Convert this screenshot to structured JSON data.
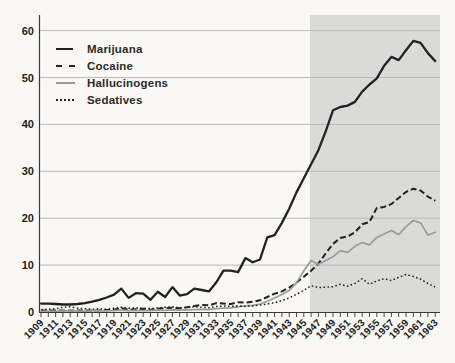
{
  "chart_data": {
    "type": "line",
    "title": "",
    "xlabel": "",
    "ylabel": "",
    "grid": "horizontal",
    "legend_position": "top-left",
    "ylim": [
      0,
      63
    ],
    "y_ticks": [
      0,
      10,
      20,
      30,
      40,
      50,
      60
    ],
    "x_tick_labels": [
      "1909",
      "1911",
      "1913",
      "1915",
      "1917",
      "1919",
      "1921",
      "1923",
      "1925",
      "1927",
      "1929",
      "1931",
      "1933",
      "1935",
      "1937",
      "1939",
      "1941",
      "1943",
      "1945",
      "1947",
      "1949",
      "1951",
      "1953",
      "1955",
      "1957",
      "1959",
      "1961",
      "1963"
    ],
    "years": [
      1909,
      1910,
      1911,
      1912,
      1913,
      1914,
      1915,
      1916,
      1917,
      1918,
      1919,
      1920,
      1921,
      1922,
      1923,
      1924,
      1925,
      1926,
      1927,
      1928,
      1929,
      1930,
      1931,
      1932,
      1933,
      1934,
      1935,
      1936,
      1937,
      1938,
      1939,
      1940,
      1941,
      1942,
      1943,
      1944,
      1945,
      1946,
      1947,
      1948,
      1949,
      1950,
      1951,
      1952,
      1953,
      1954,
      1955,
      1956,
      1957,
      1958,
      1959,
      1960,
      1961,
      1962,
      1963
    ],
    "shaded_region": {
      "x_start_year": 1946,
      "x_end": "right-edge",
      "color": "#dadad8"
    },
    "series": [
      {
        "name": "Marijuana",
        "style": "solid",
        "color": "#222222",
        "values": [
          1.8,
          1.8,
          1.7,
          1.6,
          1.6,
          1.7,
          1.9,
          2.2,
          2.6,
          3.1,
          3.7,
          5.0,
          3.0,
          4.0,
          3.9,
          2.6,
          4.3,
          3.2,
          5.3,
          3.5,
          3.8,
          5.0,
          4.7,
          4.4,
          6.3,
          8.8,
          8.8,
          8.5,
          11.5,
          10.6,
          11.2,
          15.9,
          16.4,
          19.0,
          22.0,
          25.5,
          28.5,
          31.5,
          34.5,
          38.5,
          43.0,
          43.7,
          44.0,
          44.8,
          47.0,
          48.5,
          49.8,
          52.5,
          54.4,
          53.7,
          55.8,
          57.8,
          57.4,
          55.2,
          53.5
        ]
      },
      {
        "name": "Cocaine",
        "style": "dashed",
        "color": "#222222",
        "values": [
          0.3,
          0.3,
          0.3,
          0.3,
          0.35,
          0.3,
          0.3,
          0.3,
          0.35,
          0.4,
          0.5,
          0.8,
          0.5,
          0.6,
          0.7,
          0.5,
          0.7,
          0.8,
          0.9,
          0.8,
          1.0,
          1.3,
          1.5,
          1.4,
          1.9,
          1.8,
          1.7,
          2.1,
          2.0,
          2.2,
          2.5,
          3.2,
          3.9,
          4.4,
          5.2,
          6.3,
          7.5,
          8.8,
          10.3,
          12.5,
          14.5,
          15.8,
          16.1,
          17.0,
          18.7,
          19.2,
          22.2,
          22.4,
          23.0,
          24.3,
          25.6,
          26.3,
          25.9,
          24.6,
          23.7
        ]
      },
      {
        "name": "Hallucinogens",
        "style": "solid",
        "color": "#9b9b9b",
        "values": [
          0.2,
          0.2,
          0.2,
          0.25,
          0.3,
          0.2,
          0.2,
          0.25,
          0.3,
          0.25,
          0.3,
          0.4,
          0.3,
          0.35,
          0.3,
          0.3,
          0.4,
          0.35,
          0.45,
          0.4,
          0.45,
          0.5,
          0.55,
          0.5,
          0.7,
          0.8,
          0.9,
          1.1,
          1.3,
          1.4,
          1.7,
          2.3,
          3.0,
          3.7,
          4.6,
          6.2,
          8.8,
          11.0,
          10.1,
          11.0,
          11.8,
          13.1,
          12.7,
          14.0,
          14.8,
          14.3,
          15.9,
          16.6,
          17.4,
          16.5,
          18.2,
          19.5,
          19.0,
          16.4,
          17.0
        ]
      },
      {
        "name": "Sedatives",
        "style": "dotted",
        "color": "#222222",
        "values": [
          0.5,
          0.6,
          0.7,
          1.0,
          1.1,
          0.8,
          0.7,
          0.6,
          0.7,
          0.6,
          0.8,
          1.0,
          0.8,
          0.9,
          0.8,
          0.7,
          0.9,
          1.0,
          1.1,
          0.9,
          1.0,
          1.1,
          1.0,
          0.9,
          1.2,
          1.3,
          1.2,
          1.3,
          1.2,
          1.3,
          1.5,
          1.7,
          2.0,
          2.4,
          3.0,
          3.8,
          4.6,
          5.6,
          5.2,
          5.3,
          5.4,
          5.9,
          5.5,
          6.1,
          7.1,
          5.9,
          6.6,
          7.1,
          6.7,
          7.4,
          8.0,
          7.6,
          7.0,
          6.1,
          5.3
        ]
      }
    ],
    "colors": {
      "background": "#f9f8f5",
      "shading": "#dadad8",
      "gridline": "#b9b9b9",
      "axis": "#3a3a3a",
      "line_black": "#222222",
      "line_gray": "#9b9b9b"
    }
  }
}
